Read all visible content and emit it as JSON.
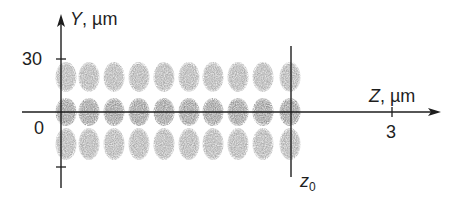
{
  "figure": {
    "y_axis": {
      "var": "Y",
      "unit": ", µm",
      "ticks": [
        {
          "label": "30",
          "y": 59
        },
        {
          "label": "0",
          "y": 112
        },
        {
          "label": "",
          "y": 167
        }
      ]
    },
    "z_axis": {
      "var": "Z",
      "unit": ", µm",
      "ticks": [
        {
          "label": "3",
          "x": 392
        }
      ]
    },
    "marker": {
      "label": "z",
      "subscript": "0",
      "x": 291
    },
    "spots": {
      "columns_x": [
        66,
        89,
        114,
        139,
        164,
        189,
        213,
        238,
        263,
        290
      ],
      "rows": [
        {
          "name": "upper",
          "cy": 77,
          "ry": 15,
          "opacity": 0.55
        },
        {
          "name": "center",
          "cy": 112,
          "ry": 14,
          "opacity": 0.75
        },
        {
          "name": "lower",
          "cy": 144,
          "ry": 16,
          "opacity": 0.55
        }
      ],
      "color": "#7a7a7a"
    },
    "colors": {
      "ink": "#1e1e1e",
      "spot": "#7a7a7a"
    }
  }
}
